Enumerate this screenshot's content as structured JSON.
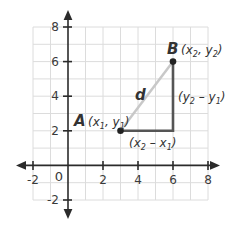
{
  "diagram": {
    "type": "coordinate-plane-distance",
    "x_ticks": [
      "-2",
      "2",
      "4",
      "6",
      "8"
    ],
    "y_ticks": [
      "8",
      "6",
      "4",
      "2",
      "-2"
    ],
    "origin_label": "0",
    "point_a": {
      "name": "A",
      "coords_label": "(x1, y1)",
      "x": 3,
      "y": 2,
      "var_x": "x",
      "sub_x": "1",
      "var_y": "y",
      "sub_y": "1"
    },
    "point_b": {
      "name": "B",
      "coords_label": "(x2, y2)",
      "x": 6,
      "y": 6,
      "var_x": "x",
      "sub_x": "2",
      "var_y": "y",
      "sub_y": "2"
    },
    "distance_label": "d",
    "horizontal_leg": {
      "label": "(x2 − x1)",
      "v1": "x",
      "s1": "2",
      "v2": "x",
      "s2": "1"
    },
    "vertical_leg": {
      "label": "(y2 − y1)",
      "v1": "y",
      "s1": "2",
      "v2": "y",
      "s2": "1"
    },
    "colors": {
      "axis": "#2b2b2b",
      "grid": "#d9d9d9",
      "hypotenuse": "#c8c8c8",
      "legs": "#555555",
      "point": "#222222"
    }
  }
}
